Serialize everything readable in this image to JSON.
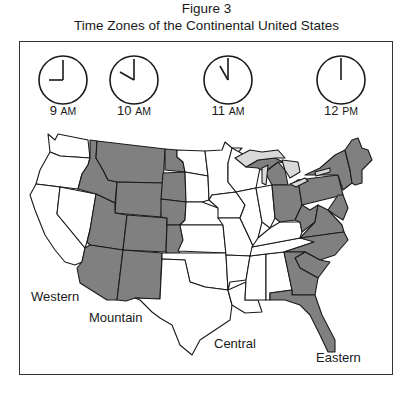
{
  "figure": {
    "label": "Figure 3",
    "title": "Time Zones of the Continental United States"
  },
  "clocks": [
    {
      "hour": "9",
      "period": "AM",
      "zone": "Western",
      "hour_angle": 270,
      "minute_angle": 0
    },
    {
      "hour": "10",
      "period": "AM",
      "zone": "Mountain",
      "hour_angle": 300,
      "minute_angle": 0
    },
    {
      "hour": "11",
      "period": "AM",
      "zone": "Central",
      "hour_angle": 330,
      "minute_angle": 0
    },
    {
      "hour": "12",
      "period": "PM",
      "zone": "Eastern",
      "hour_angle": 0,
      "minute_angle": 0
    }
  ],
  "zones": {
    "western": {
      "label": "Western",
      "fill": "#ffffff"
    },
    "mountain": {
      "label": "Mountain",
      "fill": "#808080"
    },
    "central": {
      "label": "Central",
      "fill": "#ffffff"
    },
    "eastern": {
      "label": "Eastern",
      "fill": "#808080"
    }
  },
  "colors": {
    "shaded_state": "#808080",
    "unshaded_state": "#ffffff",
    "great_lakes": "#d9d9d9",
    "outline": "#1a1a1a"
  }
}
